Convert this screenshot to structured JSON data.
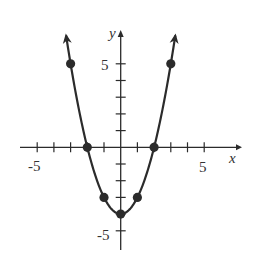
{
  "chart_data": {
    "type": "line",
    "title": "",
    "xlabel": "x",
    "ylabel": "y",
    "xlim": [
      -6,
      7
    ],
    "ylim": [
      -6,
      7
    ],
    "x_tick_labels": [
      "-5",
      "5"
    ],
    "y_tick_labels": [
      "5",
      "-5"
    ],
    "grid": false,
    "series": [
      {
        "name": "y = x^2 - 4",
        "points": [
          [
            -3,
            5
          ],
          [
            -2,
            0
          ],
          [
            -1,
            -3
          ],
          [
            0,
            -4
          ],
          [
            1,
            -3
          ],
          [
            2,
            0
          ],
          [
            3,
            5
          ]
        ],
        "arrows_at_ends": true
      }
    ]
  },
  "labels": {
    "x_axis": "x",
    "y_axis": "y",
    "x_neg": "-5",
    "x_pos": "5",
    "y_pos": "5",
    "y_neg": "-5"
  },
  "colors": {
    "ink": "#2b2b2b"
  }
}
